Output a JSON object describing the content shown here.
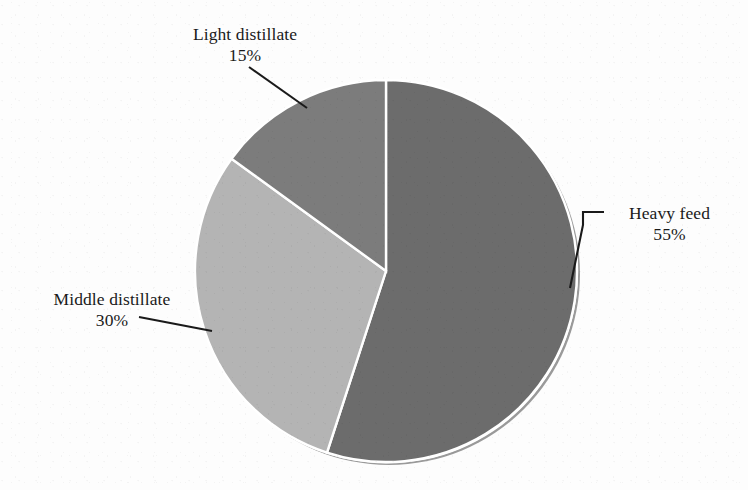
{
  "chart_data": {
    "type": "pie",
    "title": "",
    "categories": [
      "Heavy feed",
      "Middle distillate",
      "Light distillate"
    ],
    "values": [
      55,
      30,
      15
    ],
    "value_unit": "%",
    "legend": "none",
    "labels_position": "outside-with-leader-lines",
    "start_angle_deg": 0,
    "direction": "clockwise",
    "slices": [
      {
        "name": "Heavy feed",
        "label": "Heavy feed",
        "value": 55,
        "value_label": "55%",
        "color": "#6c6c6c",
        "start_angle_deg": 0,
        "end_angle_deg": 198
      },
      {
        "name": "Middle distillate",
        "label": "Middle distillate",
        "value": 30,
        "value_label": "30%",
        "color": "#b4b4b4",
        "start_angle_deg": 198,
        "end_angle_deg": 306
      },
      {
        "name": "Light distillate",
        "label": "Light distillate",
        "value": 15,
        "value_label": "15%",
        "color": "#7c7c7c",
        "start_angle_deg": 306,
        "end_angle_deg": 360
      }
    ],
    "geometry": {
      "center_x": 386,
      "center_y": 271,
      "radius": 191
    },
    "colors": {
      "background": "#fdfdfd",
      "slice_divider": "#ffffff",
      "rim_shadow": "#9a9a9a",
      "text": "#1a1a1a",
      "leader_line": "#1a1a1a"
    }
  },
  "labels": {
    "light": {
      "text": "Light distillate",
      "percent": "15%"
    },
    "heavy": {
      "text": "Heavy feed",
      "percent": "55%"
    },
    "middle": {
      "text": "Middle distillate",
      "percent": "30%"
    }
  }
}
